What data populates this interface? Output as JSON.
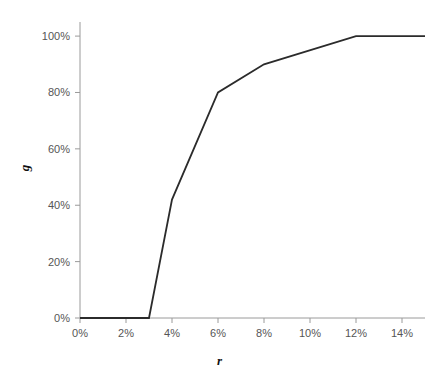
{
  "chart_data": {
    "type": "line",
    "title": "",
    "subtitle": "",
    "xlabel": "r",
    "ylabel": "g",
    "xlim": [
      0,
      15
    ],
    "ylim": [
      0,
      105
    ],
    "grid": false,
    "legend": null,
    "x_tick_labels": [
      "0%",
      "2%",
      "4%",
      "6%",
      "8%",
      "10%",
      "12%",
      "14%"
    ],
    "x_tick_values": [
      0,
      2,
      4,
      6,
      8,
      10,
      12,
      14
    ],
    "y_tick_labels": [
      "0%",
      "20%",
      "40%",
      "60%",
      "80%",
      "100%"
    ],
    "y_tick_values": [
      0,
      20,
      40,
      60,
      80,
      100
    ],
    "series": [
      {
        "name": "g",
        "x": [
          0,
          3,
          4,
          6,
          8,
          12,
          15
        ],
        "values": [
          0,
          0,
          42,
          80,
          90,
          100,
          100
        ],
        "color": "#2b2b2b"
      }
    ]
  },
  "axes": {
    "line_color": "#9a9a9a",
    "tick_color": "#9a9a9a",
    "label_color": "#555555",
    "title_color": "#111111"
  },
  "figure": {
    "background": "#ffffff"
  }
}
